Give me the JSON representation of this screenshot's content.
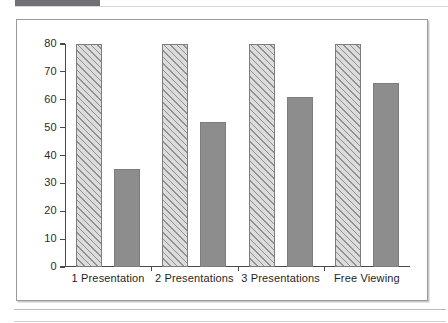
{
  "chart_data": {
    "type": "bar",
    "title": "",
    "subtitle": "",
    "xlabel": "",
    "ylabel": "",
    "categories": [
      "1 Presentation",
      "2 Presentations",
      "3 Presentations",
      "Free Viewing"
    ],
    "series": [
      {
        "name": "hatched",
        "values": [
          80,
          80,
          80,
          80
        ]
      },
      {
        "name": "solid",
        "values": [
          35,
          52,
          61,
          66
        ]
      }
    ],
    "ylim": [
      0,
      80
    ],
    "ytick_labels": [
      "80",
      "70",
      "60",
      "50",
      "40",
      "30",
      "20",
      "10",
      "0"
    ],
    "ytick_values": [
      80,
      70,
      60,
      50,
      40,
      30,
      20,
      10,
      0
    ],
    "grid": false,
    "legend": "none",
    "annotations": []
  },
  "figure": {
    "frame_border_color": "#9a9a9a",
    "background_color": "#ffffff",
    "hatched_bar_color": "#d6d6d6",
    "hatched_line_color": "#8f8f8f",
    "solid_bar_color": "#8d8d8d",
    "axis_color": "#4a4a4a",
    "text_color": "#1f1f1f"
  },
  "page": {
    "top_band_color": "#6f7175",
    "rule_color": "#bdbdbd"
  }
}
